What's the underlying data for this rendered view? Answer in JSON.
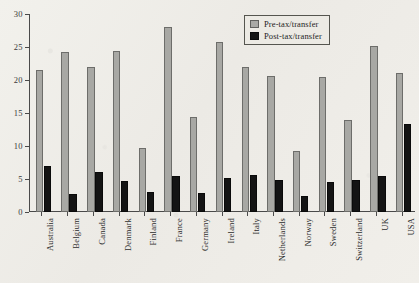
{
  "chart_data": {
    "type": "bar",
    "title": "",
    "subtitle": "",
    "xlabel": "",
    "ylabel": "",
    "ylim": [
      0,
      30
    ],
    "yticks": [
      0,
      5,
      10,
      15,
      20,
      25,
      30
    ],
    "ytick_labels": [
      "0",
      "5",
      "10",
      "15",
      "20",
      "25",
      "30"
    ],
    "grid": false,
    "legend_position": "top-right",
    "categories": [
      "Australia",
      "Belgium",
      "Canada",
      "Denmark",
      "Finland",
      "France",
      "Germany",
      "Ireland",
      "Italy",
      "Netherlands",
      "Norway",
      "Sweden",
      "Switzerland",
      "UK",
      "USA"
    ],
    "series": [
      {
        "name": "Pre-tax/transfer",
        "color": "#a8a8a4",
        "values": [
          21.5,
          24.3,
          22.0,
          24.4,
          9.7,
          28.0,
          14.4,
          25.8,
          21.9,
          20.6,
          9.2,
          20.4,
          14.0,
          25.2,
          21.0
        ]
      },
      {
        "name": "Post-tax/transfer",
        "color": "#141414",
        "values": [
          7.0,
          2.7,
          6.0,
          4.7,
          3.0,
          5.5,
          2.9,
          5.2,
          5.6,
          4.9,
          2.5,
          4.6,
          4.8,
          5.5,
          13.3
        ]
      }
    ]
  },
  "legend": {
    "items": [
      {
        "label": "Pre-tax/transfer",
        "swatch": "pre"
      },
      {
        "label": "Post-tax/transfer",
        "swatch": "post"
      }
    ]
  },
  "colors": {
    "background": "#efeeea",
    "axis": "#4a4a4a",
    "pre_tax": "#a8a8a4",
    "post_tax": "#141414",
    "text": "#2b2b2b"
  }
}
